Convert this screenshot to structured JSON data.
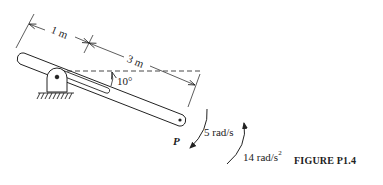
{
  "figure": {
    "caption": "FIGURE P1.4",
    "dimensions": {
      "first_segment": "1 m",
      "second_segment": "3 m"
    },
    "angle_label": "10°",
    "point_label": "P",
    "angular_velocity": {
      "value": "5 rad/s",
      "direction": "clockwise"
    },
    "angular_acceleration": {
      "value_base": "14 rad/s",
      "value_exp": "2",
      "direction": "counterclockwise"
    }
  }
}
